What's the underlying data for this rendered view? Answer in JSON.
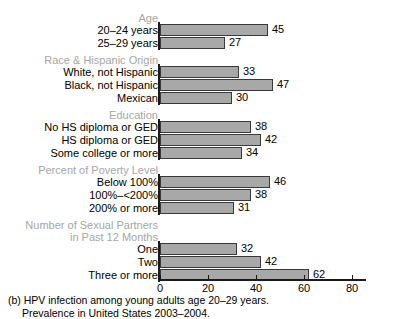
{
  "chart_data": {
    "type": "bar",
    "orientation": "horizontal",
    "title": "",
    "xlabel": "",
    "ylabel": "",
    "xlim": [
      0,
      83
    ],
    "xticks": [
      0,
      20,
      40,
      60,
      80
    ],
    "xtick_labels": [
      "0",
      "20",
      "40",
      "60",
      "80"
    ],
    "grid": false,
    "legend": null,
    "bar_color": "#a8a8a8",
    "bar_edge_color": "#3a3a3a",
    "group_label_color": "#a6a6a6",
    "axis_color": "#1a1a1a",
    "groups": [
      {
        "name": "Age",
        "header_lines": [
          "Age"
        ],
        "categories": [
          "20–24 years",
          "25–29 years"
        ],
        "values": [
          45,
          27
        ]
      },
      {
        "name": "Race & Hispanic Origin",
        "header_lines": [
          "Race & Hispanic Origin"
        ],
        "categories": [
          "White, not Hispanic",
          "Black, not Hispanic",
          "Mexican"
        ],
        "values": [
          33,
          47,
          30
        ]
      },
      {
        "name": "Education",
        "header_lines": [
          "Education"
        ],
        "categories": [
          "No HS diploma or GED",
          "HS diploma or GED",
          "Some college or more"
        ],
        "values": [
          38,
          42,
          34
        ]
      },
      {
        "name": "Percent of Poverty Level",
        "header_lines": [
          "Percent of Poverty Level"
        ],
        "categories": [
          "Below 100%",
          "100%–<200%",
          "200% or more"
        ],
        "values": [
          46,
          38,
          31
        ]
      },
      {
        "name": "Number of Sexual Partners in Past 12 Months",
        "header_lines": [
          "Number of Sexual Partners",
          "in Past 12 Months"
        ],
        "categories": [
          "One",
          "Two",
          "Three or more"
        ],
        "values": [
          32,
          42,
          62
        ]
      }
    ],
    "categories": [
      "20–24 years",
      "25–29 years",
      "White, not Hispanic",
      "Black, not Hispanic",
      "Mexican",
      "No HS diploma or GED",
      "HS diploma or GED",
      "Some college or more",
      "Below 100%",
      "100%–<200%",
      "200% or more",
      "One",
      "Two",
      "Three or more"
    ],
    "values": [
      45,
      27,
      33,
      47,
      30,
      38,
      42,
      34,
      46,
      38,
      31,
      32,
      42,
      62
    ]
  },
  "caption": {
    "line1": "(b) HPV infection among young adults age 20–29 years.",
    "line2": "Prevalence in United States 2003–2004."
  }
}
